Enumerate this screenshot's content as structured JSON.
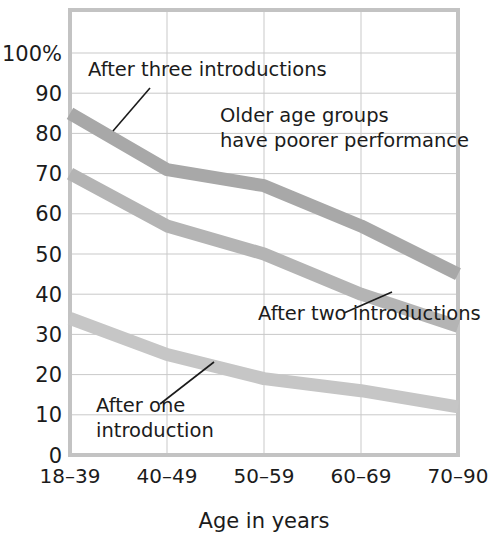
{
  "chart_data": {
    "type": "line",
    "title": "",
    "xlabel": "Age in years",
    "ylabel": "",
    "categories": [
      "18–39",
      "40–49",
      "50–59",
      "60–69",
      "70–90"
    ],
    "ylim": [
      0,
      100
    ],
    "ytick_labels": [
      "0",
      "10",
      "20",
      "30",
      "40",
      "50",
      "60",
      "70",
      "80",
      "90",
      "100%"
    ],
    "ytick_values": [
      0,
      10,
      20,
      30,
      40,
      50,
      60,
      70,
      80,
      90,
      100
    ],
    "grid": true,
    "legend_position": "inline-annotations",
    "series": [
      {
        "name": "After three introductions",
        "values": [
          85,
          71,
          67,
          57,
          45
        ],
        "color": "#a8a8a8",
        "width": 13
      },
      {
        "name": "After two introductions",
        "values": [
          70,
          57,
          50,
          40,
          32
        ],
        "color": "#b4b4b4",
        "width": 13
      },
      {
        "name": "After one introduction",
        "values": [
          34,
          25,
          19,
          16,
          12
        ],
        "color": "#c6c6c6",
        "width": 13
      }
    ],
    "annotations": [
      {
        "id": "after-three",
        "lines": [
          "After three introductions"
        ],
        "text_x": 88,
        "text_y": 76,
        "leader": [
          150,
          88,
          113,
          131
        ]
      },
      {
        "id": "older-age-groups",
        "lines": [
          "Older age groups",
          "have poorer performance"
        ],
        "text_x": 220,
        "text_y": 122,
        "leader": null
      },
      {
        "id": "after-two",
        "lines": [
          "After two introductions"
        ],
        "text_x": 258,
        "text_y": 320,
        "leader": [
          344,
          313,
          392,
          292
        ]
      },
      {
        "id": "after-one",
        "lines": [
          "After one",
          "introduction"
        ],
        "text_x": 96,
        "text_y": 412,
        "leader": [
          160,
          404,
          214,
          362
        ]
      }
    ]
  },
  "axis": {
    "x_label": "Age in years",
    "y_top_label": "100%"
  },
  "colors": {
    "grid": "#c9c9c9",
    "frame": "#c3c3c3",
    "text": "#1b1b1b",
    "background": "#ffffff"
  }
}
